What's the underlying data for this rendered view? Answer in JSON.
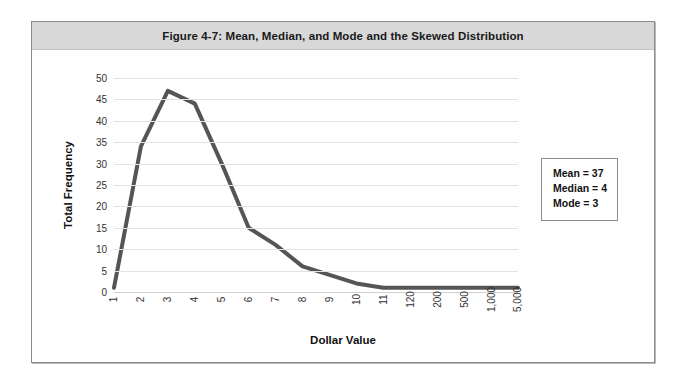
{
  "figure": {
    "title": "Figure 4-7: Mean, Median, and Mode and the Skewed Distribution"
  },
  "stats_box": {
    "mean_line": "Mean = 37",
    "median_line": "Median = 4",
    "mode_line": "Mode = 3"
  },
  "chart_data": {
    "type": "line",
    "title": "Figure 4-7: Mean, Median, and Mode and the Skewed Distribution",
    "xlabel": "Dollar Value",
    "ylabel": "Total Frequency",
    "categories": [
      "1",
      "2",
      "3",
      "4",
      "5",
      "6",
      "7",
      "8",
      "9",
      "10",
      "11",
      "120",
      "200",
      "500",
      "1,000",
      "5,000"
    ],
    "values": [
      1,
      34,
      47,
      44,
      30,
      15,
      11,
      6,
      4,
      2,
      1,
      1,
      1,
      1,
      1,
      1
    ],
    "ylim": [
      0,
      50
    ],
    "yticks": [
      0,
      5,
      10,
      15,
      20,
      25,
      30,
      35,
      40,
      45,
      50
    ],
    "grid": true,
    "legend": false,
    "line_color": "#555555",
    "line_width": 4,
    "annotations": [
      "Mean = 37",
      "Median = 4",
      "Mode = 3"
    ]
  }
}
